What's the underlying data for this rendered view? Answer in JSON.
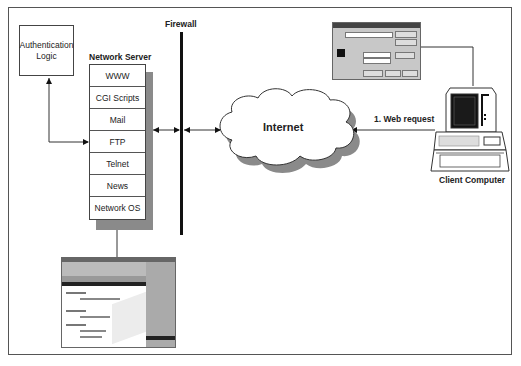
{
  "diagram": {
    "firewall_label": "Firewall",
    "server_title": "Network Server",
    "server_services": [
      "WWW",
      "CGI Scripts",
      "Mail",
      "FTP",
      "Telnet",
      "News",
      "Network OS"
    ],
    "auth_label_line1": "Authentication",
    "auth_label_line2": "Logic",
    "internet_label": "Internet",
    "request_label": "1. Web request",
    "client_label": "Client Computer"
  },
  "colors": {
    "line": "#333333",
    "shadow": "#8a8a8a",
    "firewall": "#111111",
    "dialog_bg": "#c8c8c8"
  }
}
